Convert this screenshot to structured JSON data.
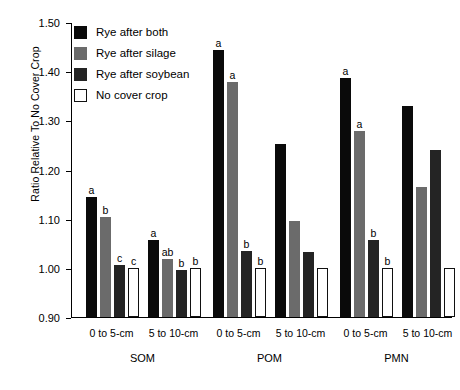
{
  "chart_data": {
    "type": "bar",
    "title": "",
    "xlabel": "",
    "ylabel": "Ratio Relative To No Cover Crop",
    "ylim": [
      0.9,
      1.5
    ],
    "ytick_labels": [
      "1.50",
      "1.40",
      "1.30",
      "1.20",
      "1.10",
      "1.00",
      "0.90"
    ],
    "ytick_values": [
      1.5,
      1.4,
      1.3,
      1.2,
      1.1,
      1.0,
      0.9
    ],
    "grid": false,
    "legend_position": "upper-left-inside",
    "groups": [
      "SOM",
      "POM",
      "PMN"
    ],
    "subgroups": [
      "0 to 5-cm",
      "5 to 10-cm"
    ],
    "categories": [
      "SOM 0 to 5-cm",
      "SOM 5 to 10-cm",
      "POM 0 to 5-cm",
      "POM 5 to 10-cm",
      "PMN 0 to 5-cm",
      "PMN 5 to 10-cm"
    ],
    "series": [
      {
        "name": "Rye after both",
        "color": "#0a0a0a",
        "values": [
          1.145,
          1.057,
          1.443,
          1.252,
          1.387,
          1.33
        ],
        "letters": [
          "a",
          "a",
          "a",
          "",
          "a",
          ""
        ]
      },
      {
        "name": "Rye after silage",
        "color": "#6b6b6b",
        "values": [
          1.104,
          1.018,
          1.378,
          1.096,
          1.278,
          1.165
        ],
        "letters": [
          "b",
          "ab",
          "a",
          "",
          "a",
          ""
        ]
      },
      {
        "name": "Rye after soybean",
        "color": "#242424",
        "values": [
          1.005,
          0.995,
          1.034,
          1.032,
          1.056,
          1.24
        ],
        "letters": [
          "c",
          "b",
          "b",
          "",
          "b",
          ""
        ]
      },
      {
        "name": "No cover crop",
        "color": "#ffffff",
        "values": [
          1.0,
          1.0,
          1.0,
          1.0,
          1.0,
          1.0
        ],
        "letters": [
          "c",
          "b",
          "b",
          "",
          "b",
          ""
        ]
      }
    ]
  },
  "legend": {
    "items": [
      {
        "label": "Rye after both"
      },
      {
        "label": "Rye after silage"
      },
      {
        "label": "Rye after soybean"
      },
      {
        "label": "No cover crop"
      }
    ]
  }
}
